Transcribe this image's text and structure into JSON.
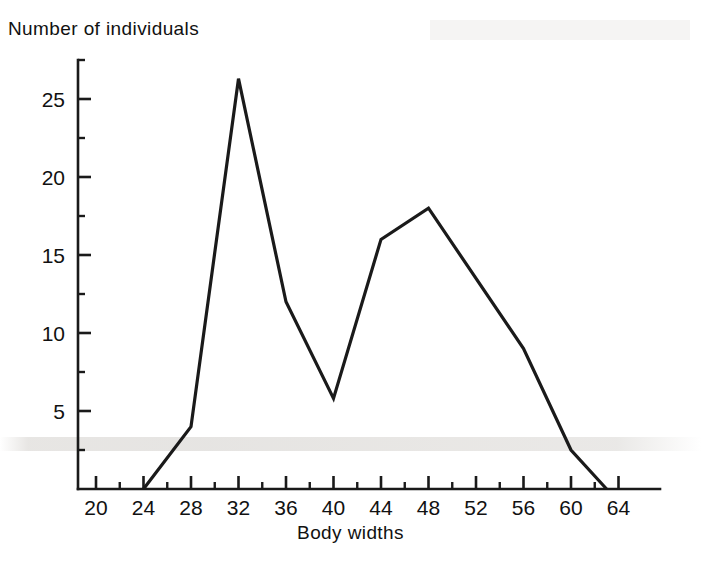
{
  "chart_data": {
    "type": "line",
    "title": "",
    "xlabel": "Body widths",
    "ylabel": "Number of individuals",
    "xlim": [
      18,
      66
    ],
    "ylim": [
      0,
      27.5
    ],
    "grid": false,
    "legend": null,
    "x_ticks": [
      20,
      24,
      28,
      32,
      36,
      40,
      44,
      48,
      52,
      56,
      60,
      64
    ],
    "x_tick_labels": [
      "20",
      "24",
      "28",
      "32",
      "36",
      "40",
      "44",
      "48",
      "52",
      "56",
      "60",
      "64"
    ],
    "x_minor_ticks": [
      22,
      26,
      30,
      34,
      38,
      42,
      46,
      50,
      54,
      58,
      62
    ],
    "y_ticks": [
      5,
      10,
      15,
      20,
      25
    ],
    "y_tick_labels": [
      "5",
      "10",
      "15",
      "20",
      "25"
    ],
    "y_minor_ticks": [
      2.5,
      7.5,
      12.5,
      17.5,
      22.5,
      27.5
    ],
    "x": [
      24,
      28,
      32,
      36,
      40,
      44,
      48,
      56,
      60,
      63
    ],
    "values": [
      0,
      4,
      26.3,
      12,
      5.8,
      16,
      18,
      9,
      2.5,
      0
    ],
    "series": [
      {
        "name": "Body width frequency distribution",
        "x": [
          24,
          28,
          32,
          36,
          40,
          44,
          48,
          56,
          60,
          63
        ],
        "values": [
          0,
          4,
          26.3,
          12,
          5.8,
          16,
          18,
          9,
          2.5,
          0
        ]
      }
    ],
    "line_color": "#1a1a1a",
    "line_width": 3.2,
    "background": "#ffffff"
  },
  "axes": {
    "y_title": "Number of individuals",
    "x_title": "Body widths"
  }
}
